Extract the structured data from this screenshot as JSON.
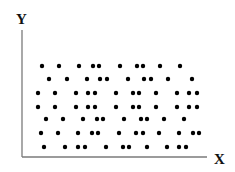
{
  "chart_data": {
    "type": "scatter",
    "title": "",
    "xlabel": "X",
    "ylabel": "Y",
    "grid": false,
    "legend": null,
    "axes": {
      "origin_px": [
        22,
        157
      ],
      "x_end_px": 207,
      "y_top_px": 30,
      "color": "#7a7a7a"
    },
    "marker": {
      "shape": "circle",
      "radius_px": 2.2,
      "color": "#000000"
    },
    "rows": [
      {
        "y": 66,
        "x": [
          42,
          59,
          79,
          93,
          99,
          120,
          137,
          143,
          160,
          180
        ]
      },
      {
        "y": 79,
        "x": [
          49,
          67,
          87,
          100,
          107,
          128,
          144,
          151,
          168,
          192
        ]
      },
      {
        "y": 93,
        "x": [
          38,
          55,
          76,
          88,
          95,
          116,
          133,
          139,
          156,
          177,
          189,
          197
        ]
      },
      {
        "y": 107,
        "x": [
          38,
          55,
          76,
          88,
          95,
          116,
          133,
          139,
          156,
          177,
          189,
          197
        ]
      },
      {
        "y": 119,
        "x": [
          46,
          63,
          83,
          97,
          103,
          124,
          141,
          147,
          164,
          184
        ]
      },
      {
        "y": 133,
        "x": [
          41,
          58,
          78,
          92,
          98,
          119,
          136,
          143,
          159,
          179,
          193,
          199
        ]
      },
      {
        "y": 147,
        "x": [
          44,
          65,
          78,
          85,
          106,
          123,
          129,
          147,
          167,
          179,
          186
        ]
      }
    ],
    "note": "No tick marks or numeric tick labels are shown; point coordinates are given in pixel space."
  }
}
